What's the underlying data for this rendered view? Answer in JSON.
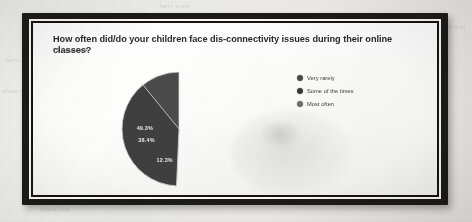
{
  "document": {
    "kind": "photographed-page",
    "frame_color": "#1c1b1a",
    "page_color": "#f2f2f0"
  },
  "form": {
    "question": "How often did/do your children face dis-connectivity issues during their online classes?",
    "responses_label": "73 responses"
  },
  "legend": {
    "items": [
      {
        "label": "Very rarely",
        "color": "#4a4a4a"
      },
      {
        "label": "Some of the times",
        "color": "#3a3a3a"
      },
      {
        "label": "Most often",
        "color": "#6f6f6f"
      }
    ]
  },
  "ghost_text": {
    "g1": "a tiny faded line of show-through text",
    "g2": "faint bleed-through of text from the reverse side of the page",
    "g3": "show-through",
    "g4": "faded line",
    "g5": "faint mark"
  },
  "chart_data": {
    "type": "pie",
    "title": "How often did/do your children face dis-connectivity issues during their online classes?",
    "subtitle": "73 responses",
    "total_responses": 73,
    "legend_position": "right",
    "labels": [
      "Very rarely",
      "Some of the times",
      "Most often"
    ],
    "values": [
      49.3,
      12.3,
      38.4
    ],
    "value_suffix": "%",
    "slices": [
      {
        "label": "Very rarely",
        "value": 49.3,
        "display": "49.3%",
        "color": "#4a4a4a"
      },
      {
        "label": "Some of the times",
        "value": 12.3,
        "display": "12.3%",
        "color": "#8d8d8d"
      },
      {
        "label": "Most often",
        "value": 38.4,
        "display": "38.4%",
        "color": "#3f3f3f"
      }
    ]
  }
}
